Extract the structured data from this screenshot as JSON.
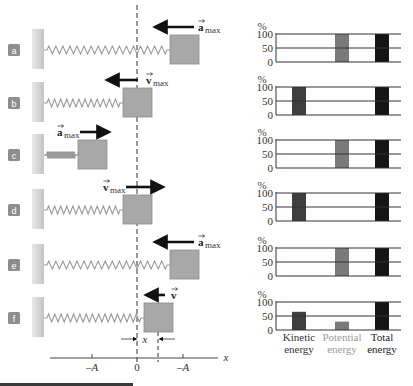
{
  "diagram": {
    "dashed_line_x": 137,
    "colors": {
      "wall": "#cfcfcf",
      "spring": "#9a9a9a",
      "block": "#a8a8a8",
      "block_border": "#8a8a8a",
      "label_badge": "#8e8e8e",
      "arrow": "#111111",
      "kinetic": "#3f3f3f",
      "potential": "#7a7a7a",
      "total": "#151515",
      "gridline": "#333333",
      "potential_label": "#9a9a9a"
    },
    "rows": [
      {
        "id": "a",
        "label": "a",
        "vector": "a",
        "subscript": "max",
        "arrow_dir": "left"
      },
      {
        "id": "b",
        "label": "b",
        "vector": "v",
        "subscript": "max",
        "arrow_dir": "left"
      },
      {
        "id": "c",
        "label": "c",
        "vector": "a",
        "subscript": "max",
        "arrow_dir": "right"
      },
      {
        "id": "d",
        "label": "d",
        "vector": "v",
        "subscript": "max",
        "arrow_dir": "right"
      },
      {
        "id": "e",
        "label": "e",
        "vector": "a",
        "subscript": "max",
        "arrow_dir": "left"
      },
      {
        "id": "f",
        "label": "f",
        "vector": "v",
        "subscript": "",
        "arrow_dir": "left"
      }
    ],
    "displacement_label": "x",
    "axis": {
      "label": "x",
      "ticks": [
        "–A",
        "0",
        "–A"
      ]
    }
  },
  "chart_data": [
    {
      "type": "bar",
      "panel": "a",
      "ylabel": "%",
      "yticks": [
        "100",
        "50",
        "0"
      ],
      "ylim": [
        0,
        100
      ],
      "categories": [
        "Kinetic energy",
        "Potential energy",
        "Total energy"
      ],
      "values": [
        0,
        100,
        100
      ]
    },
    {
      "type": "bar",
      "panel": "b",
      "ylabel": "%",
      "yticks": [
        "100",
        "50",
        "0"
      ],
      "ylim": [
        0,
        100
      ],
      "categories": [
        "Kinetic energy",
        "Potential energy",
        "Total energy"
      ],
      "values": [
        100,
        0,
        100
      ]
    },
    {
      "type": "bar",
      "panel": "c",
      "ylabel": "%",
      "yticks": [
        "100",
        "50",
        "0"
      ],
      "ylim": [
        0,
        100
      ],
      "categories": [
        "Kinetic energy",
        "Potential energy",
        "Total energy"
      ],
      "values": [
        0,
        100,
        100
      ]
    },
    {
      "type": "bar",
      "panel": "d",
      "ylabel": "%",
      "yticks": [
        "100",
        "50",
        "0"
      ],
      "ylim": [
        0,
        100
      ],
      "categories": [
        "Kinetic energy",
        "Potential energy",
        "Total energy"
      ],
      "values": [
        100,
        0,
        100
      ]
    },
    {
      "type": "bar",
      "panel": "e",
      "ylabel": "%",
      "yticks": [
        "100",
        "50",
        "0"
      ],
      "ylim": [
        0,
        100
      ],
      "categories": [
        "Kinetic energy",
        "Potential energy",
        "Total energy"
      ],
      "values": [
        0,
        100,
        100
      ]
    },
    {
      "type": "bar",
      "panel": "f",
      "ylabel": "%",
      "yticks": [
        "100",
        "50",
        "0"
      ],
      "ylim": [
        0,
        100
      ],
      "categories": [
        "Kinetic energy",
        "Potential energy",
        "Total energy"
      ],
      "values": [
        65,
        30,
        100
      ]
    }
  ],
  "legend": {
    "kinetic": [
      "Kinetic",
      "energy"
    ],
    "potential": [
      "Potential",
      "energy"
    ],
    "total": [
      "Total",
      "energy"
    ]
  }
}
